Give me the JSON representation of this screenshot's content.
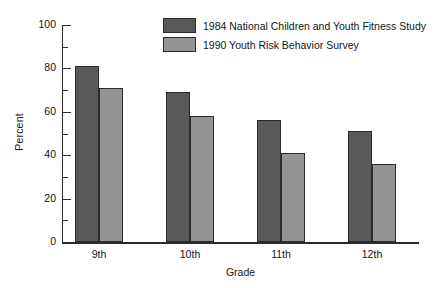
{
  "chart_data": {
    "type": "bar",
    "title": "",
    "xlabel": "Grade",
    "ylabel": "Percent",
    "categories": [
      "9th",
      "10th",
      "11th",
      "12th"
    ],
    "series": [
      {
        "name": "1984 National Children and Youth Fitness Study",
        "color": "#595959",
        "values": [
          81,
          69,
          56,
          51
        ]
      },
      {
        "name": "1990 Youth Risk Behavior Survey",
        "color": "#949494",
        "values": [
          71,
          58,
          41,
          36
        ]
      }
    ],
    "ylim": [
      0,
      100
    ],
    "yticks": [
      0,
      20,
      40,
      60,
      80,
      100
    ],
    "yticks_minor": [
      10,
      30,
      50,
      70,
      90
    ],
    "ytick_labels": [
      "0",
      "20",
      "40",
      "60",
      "80",
      "100"
    ],
    "grid": false,
    "legend_position": "top-center"
  },
  "legend": {
    "entries": [
      {
        "label": "1984 National Children and Youth Fitness Study",
        "color": "#595959"
      },
      {
        "label": "1990 Youth Risk Behavior Survey",
        "color": "#949494"
      }
    ]
  },
  "axes": {
    "y_title": "Percent",
    "x_title": "Grade"
  },
  "colors": {
    "series_1": "#595959",
    "series_2": "#949494",
    "axis": "#2b2b2b",
    "background": "#ffffff"
  }
}
